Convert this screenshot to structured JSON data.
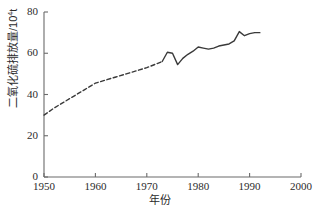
{
  "chart_data": {
    "type": "line",
    "title": "",
    "xlabel": "年份",
    "ylabel": "二氧化硫排放量/10⁴t",
    "ylabel_base": "二氧化硫排放量/10",
    "ylabel_exp": "4",
    "ylabel_unit": "t",
    "xlim": [
      1950,
      2000
    ],
    "ylim": [
      0,
      80
    ],
    "xticks": [
      1950,
      1960,
      1970,
      1980,
      1990,
      2000
    ],
    "xtick_labels": [
      "1950",
      "1960",
      "1970",
      "1980",
      "1990",
      "2000"
    ],
    "yticks": [
      0,
      20,
      40,
      60,
      80
    ],
    "ytick_labels": [
      "0",
      "20",
      "40",
      "60",
      "80"
    ],
    "grid": false,
    "legend": "none",
    "line_color": "#3a3a3a",
    "axis_color": "#6b6b6b",
    "series": [
      {
        "name": "estimated-so2-emissions",
        "style": "dashed",
        "x": [
          1950,
          1952,
          1954,
          1956,
          1958,
          1960,
          1962,
          1964,
          1966,
          1968,
          1970,
          1972,
          1973
        ],
        "values": [
          30.0,
          33.5,
          36.5,
          39.5,
          42.5,
          45.5,
          47.0,
          48.5,
          50.0,
          51.5,
          53.0,
          55.0,
          56.0
        ]
      },
      {
        "name": "measured-so2-emissions",
        "style": "solid",
        "x": [
          1973,
          1974,
          1975,
          1976,
          1977,
          1978,
          1979,
          1980,
          1981,
          1982,
          1983,
          1984,
          1985,
          1986,
          1987,
          1988,
          1989,
          1990,
          1991,
          1992
        ],
        "values": [
          56.0,
          60.5,
          60.0,
          54.5,
          57.5,
          59.5,
          61.0,
          63.0,
          62.5,
          62.0,
          62.5,
          63.5,
          64.0,
          64.5,
          66.0,
          70.5,
          68.5,
          69.5,
          70.0,
          70.0
        ]
      }
    ]
  }
}
